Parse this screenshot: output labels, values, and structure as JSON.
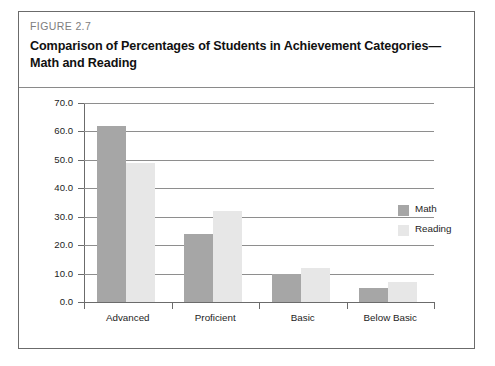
{
  "figure": {
    "number": "FIGURE 2.7",
    "title": "Comparison of Percentages of Students in Achievement Categories—Math and Reading"
  },
  "colors": {
    "math": "#a6a6a6",
    "reading": "#e7e7e7",
    "axis": "#6b6b6b",
    "grid": "#8e8e8e",
    "border": "#6b6b6b"
  },
  "chart_data": {
    "type": "bar",
    "title": "Comparison of Percentages of Students in Achievement Categories—Math and Reading",
    "xlabel": "",
    "ylabel": "",
    "categories": [
      "Advanced",
      "Proficient",
      "Basic",
      "Below Basic"
    ],
    "series": [
      {
        "name": "Math",
        "values": [
          62.0,
          24.0,
          10.0,
          5.0
        ],
        "color": "#a6a6a6"
      },
      {
        "name": "Reading",
        "values": [
          49.0,
          32.0,
          12.0,
          7.0
        ],
        "color": "#e7e7e7"
      }
    ],
    "ylim": [
      0.0,
      70.0
    ],
    "ytick_labels": [
      "70.0",
      "60.0",
      "50.0",
      "40.0",
      "30.0",
      "20.0",
      "10.0",
      "0.0"
    ],
    "ytick_values": [
      70.0,
      60.0,
      50.0,
      40.0,
      30.0,
      20.0,
      10.0,
      0.0
    ],
    "grid": true,
    "grid_axis": "y",
    "legend_position": "right-inside",
    "legend": [
      "Math",
      "Reading"
    ]
  }
}
